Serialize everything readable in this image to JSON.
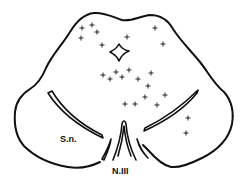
{
  "diagram": {
    "labels": {
      "substantia_nigra": "S.n.",
      "oculomotor_nerve": "N.III"
    },
    "marker_symbol": "+",
    "colors": {
      "ink": "#111111",
      "background": "#ffffff"
    },
    "markers": [
      [
        82,
        28
      ],
      [
        92,
        25
      ],
      [
        97,
        32
      ],
      [
        81,
        38
      ],
      [
        102,
        45
      ],
      [
        127,
        37
      ],
      [
        155,
        28
      ],
      [
        163,
        44
      ],
      [
        103,
        75
      ],
      [
        110,
        79
      ],
      [
        116,
        72
      ],
      [
        122,
        77
      ],
      [
        129,
        70
      ],
      [
        138,
        79
      ],
      [
        151,
        73
      ],
      [
        148,
        86
      ],
      [
        125,
        104
      ],
      [
        135,
        104
      ],
      [
        145,
        97
      ],
      [
        157,
        105
      ],
      [
        165,
        95
      ],
      [
        188,
        118
      ],
      [
        186,
        133
      ]
    ]
  }
}
